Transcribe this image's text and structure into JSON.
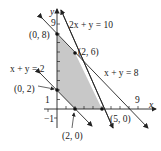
{
  "diagram": {
    "type": "feasible-region-graph",
    "axes": {
      "x_label": "x",
      "y_label": "y",
      "x_tick_label": "9",
      "y_tick_label": "9",
      "neg_x_label": "−1",
      "neg_y_label": "−1",
      "one_y_label": "1"
    },
    "lines": [
      {
        "id": "line1",
        "equation": "2x + y = 10"
      },
      {
        "id": "line2",
        "equation": "x + y = 8"
      },
      {
        "id": "line3",
        "equation": "x + y = 2"
      }
    ],
    "points": [
      {
        "label": "(0, 8)"
      },
      {
        "label": "(2, 6)"
      },
      {
        "label": "(0, 2)"
      },
      {
        "label": "(2, 0)"
      },
      {
        "label": "(5, 0)"
      }
    ],
    "region_color": "#c8c8c8",
    "line_color": "#222222"
  }
}
